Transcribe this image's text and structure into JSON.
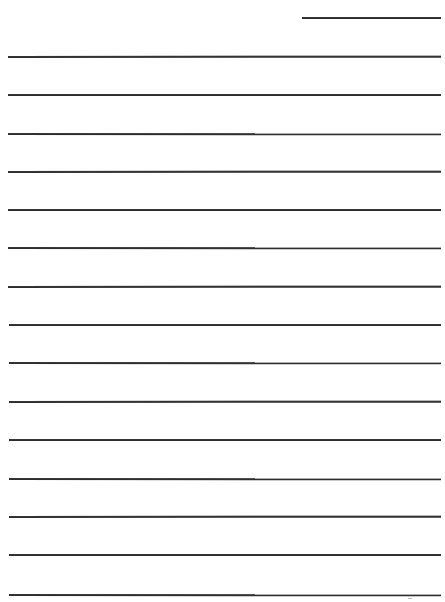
{
  "document": {
    "type": "lined-writing-page",
    "ink_color": "#2e2e2e",
    "background_color": "#ffffff",
    "header_line": {
      "x1": 302,
      "x2": 441,
      "y": 17
    },
    "ruled_lines": [
      {
        "y": 56,
        "x1": 8,
        "x2": 441
      },
      {
        "y": 94,
        "x1": 8,
        "x2": 441
      },
      {
        "y": 133,
        "x1": 8,
        "x2": 441
      },
      {
        "y": 171,
        "x1": 8,
        "x2": 441
      },
      {
        "y": 209,
        "x1": 8,
        "x2": 441
      },
      {
        "y": 247,
        "x1": 8,
        "x2": 441
      },
      {
        "y": 286,
        "x1": 8,
        "x2": 441
      },
      {
        "y": 324,
        "x1": 9,
        "x2": 441
      },
      {
        "y": 362,
        "x1": 9,
        "x2": 441
      },
      {
        "y": 401,
        "x1": 9,
        "x2": 441
      },
      {
        "y": 439,
        "x1": 9,
        "x2": 441
      },
      {
        "y": 478,
        "x1": 9,
        "x2": 441
      },
      {
        "y": 516,
        "x1": 9,
        "x2": 441
      },
      {
        "y": 554,
        "x1": 9,
        "x2": 441
      },
      {
        "y": 594,
        "x1": 9,
        "x2": 441
      }
    ],
    "text_content": []
  }
}
